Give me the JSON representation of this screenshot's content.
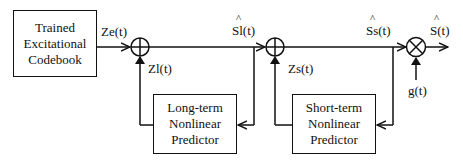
{
  "blocks": {
    "codebook": [
      "Trained",
      "Excitational",
      "Codebook"
    ],
    "long_term": [
      "Long-term",
      "Nonlinear",
      "Predictor"
    ],
    "short_term": [
      "Short-term",
      "Nonlinear",
      "Predictor"
    ]
  },
  "signals": {
    "ze": "Ze(t)",
    "zl": "Zl(t)",
    "sl_hat": "Sl(t)",
    "zs": "Zs(t)",
    "ss_hat": "Ss(t)",
    "s_hat": "S(t)",
    "g": "g(t)",
    "hat_mark": "^"
  },
  "operators": {
    "adder_symbol": "plus",
    "multiplier_symbol": "times"
  }
}
